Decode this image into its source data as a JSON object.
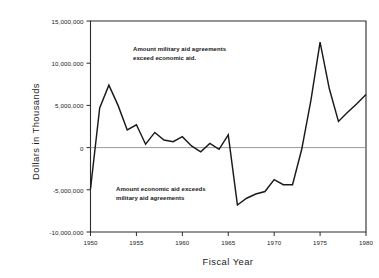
{
  "chart_data": {
    "type": "line",
    "title": "",
    "xlabel": "Fiscal Year",
    "ylabel": "Dollars in Thousands",
    "xlim": [
      1950,
      1980
    ],
    "ylim": [
      -10000000,
      15000000
    ],
    "grid": false,
    "legend": "none",
    "zero_reference_line": true,
    "y_ticks": [
      {
        "value": 15000000,
        "label": "15,000,000"
      },
      {
        "value": 10000000,
        "label": "10,000,000"
      },
      {
        "value": 5000000,
        "label": "5,000,000"
      },
      {
        "value": 0,
        "label": "0"
      },
      {
        "value": -5000000,
        "label": "-5,000,000"
      },
      {
        "value": -10000000,
        "label": "-10,000,000"
      }
    ],
    "x_ticks": [
      {
        "value": 1950,
        "label": "1950"
      },
      {
        "value": 1955,
        "label": "1955"
      },
      {
        "value": 1960,
        "label": "1960"
      },
      {
        "value": 1965,
        "label": "1965"
      },
      {
        "value": 1970,
        "label": "1970"
      },
      {
        "value": 1975,
        "label": "1975"
      },
      {
        "value": 1980,
        "label": "1980"
      }
    ],
    "series": [
      {
        "name": "Military aid agreements minus economic aid",
        "color": "#1a1a1a",
        "x": [
          1950,
          1951,
          1952,
          1953,
          1954,
          1955,
          1956,
          1957,
          1958,
          1959,
          1960,
          1961,
          1962,
          1963,
          1964,
          1965,
          1966,
          1967,
          1968,
          1969,
          1970,
          1971,
          1972,
          1973,
          1974,
          1975,
          1976,
          1977,
          1978,
          1979,
          1980
        ],
        "values": [
          -4900000,
          4700000,
          7400000,
          5000000,
          2100000,
          2700000,
          400000,
          1800000,
          900000,
          700000,
          1300000,
          200000,
          -500000,
          500000,
          -200000,
          1500000,
          -6800000,
          -6000000,
          -5500000,
          -5200000,
          -3800000,
          -4400000,
          -4400000,
          -200000,
          5600000,
          12500000,
          7000000,
          3100000,
          4200000,
          5200000,
          6300000
        ]
      }
    ],
    "annotations": [
      {
        "id": "upper",
        "lines": [
          "Amount military aid agreements",
          "exceed economic aid."
        ],
        "x": 1955,
        "y": 11000000
      },
      {
        "id": "lower",
        "lines": [
          "Amount economic aid exceeds",
          "military aid agreements"
        ],
        "x": 1953,
        "y": -4000000
      }
    ]
  },
  "annotation_upper": {
    "line1": "Amount military aid agreements",
    "line2": "exceed economic aid."
  },
  "annotation_lower": {
    "line1": "Amount economic aid exceeds",
    "line2": "military aid agreements"
  }
}
